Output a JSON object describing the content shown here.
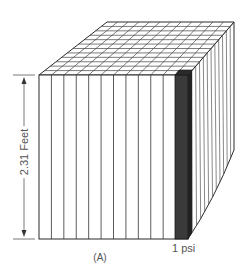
{
  "figure": {
    "caption": "(A)",
    "dimension_label": "2.31 Feet",
    "column_label": "1 psi",
    "colors": {
      "line": "#2a2a2a",
      "highlight_column": "#3a3a3a",
      "background": "#ffffff",
      "text": "#555555"
    },
    "cube": {
      "front_columns": 12,
      "top_grid_rows": 12,
      "top_grid_cols": 12,
      "right_face_columns": 12,
      "highlighted_column_index": 12
    }
  }
}
